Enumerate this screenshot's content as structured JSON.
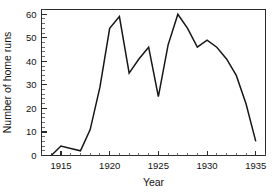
{
  "chart_data": {
    "type": "line",
    "title": "",
    "xlabel": "Year",
    "ylabel": "Number of home runs",
    "xlim": [
      1913,
      1936
    ],
    "ylim": [
      0,
      62
    ],
    "grid": false,
    "legend": null,
    "x_ticks": [
      1915,
      1920,
      1925,
      1930,
      1935
    ],
    "x_tick_labels": [
      "1915",
      "1920",
      "1925",
      "1930",
      "1935"
    ],
    "x_minor_step": 1,
    "y_ticks": [
      0,
      10,
      20,
      30,
      40,
      50,
      60
    ],
    "y_tick_labels": [
      "0",
      "10",
      "20",
      "30",
      "40",
      "50",
      "60"
    ],
    "y_minor_step": 2,
    "line_color": "#171717",
    "x": [
      1914,
      1915,
      1916,
      1917,
      1918,
      1919,
      1920,
      1921,
      1922,
      1923,
      1924,
      1925,
      1926,
      1927,
      1928,
      1929,
      1930,
      1931,
      1932,
      1933,
      1934,
      1935
    ],
    "values": [
      0,
      4,
      3,
      2,
      11,
      29,
      54,
      59,
      35,
      41,
      46,
      25,
      47,
      60,
      54,
      46,
      49,
      46,
      41,
      34,
      22,
      6
    ],
    "series": [
      {
        "name": "Number of home runs",
        "values": [
          0,
          4,
          3,
          2,
          11,
          29,
          54,
          59,
          35,
          41,
          46,
          25,
          47,
          60,
          54,
          46,
          49,
          46,
          41,
          34,
          22,
          6
        ]
      }
    ]
  }
}
